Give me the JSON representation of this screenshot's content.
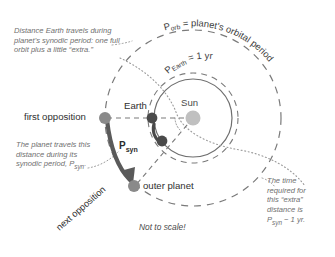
{
  "diagram": {
    "title_note": "Not to scale!",
    "colors": {
      "sun": "#c0c0c0",
      "earth_dot": "#4a4a4a",
      "planet_dot": "#8a8a8a",
      "orbit_line": "#7a7a7a",
      "arrow": "#555555",
      "caption_text": "#6f6f6f",
      "label_text": "#2f2f2f"
    },
    "labels": {
      "sun": "Sun",
      "earth": "Earth",
      "first_opposition": "first opposition",
      "next_opposition": "next opposition",
      "outer_planet": "outer planet",
      "not_to_scale": "Not to scale!",
      "p_syn": "P",
      "p_syn_sub": "syn"
    },
    "arc_labels": {
      "orbital_period": "Pₒᵣᵇ = planet's orbital period",
      "orbital_period_parts": {
        "symbol": "P",
        "subscript": "orb",
        "text": "= planet's orbital period"
      },
      "earth_period_parts": {
        "symbol": "P",
        "subscript": "Earth",
        "text": "= 1 yr"
      }
    },
    "captions": {
      "top_left": "Distance Earth travels during planet's synodic period: one full orbit plus a little “extra.”",
      "mid_left_line1": "The planet travels this",
      "mid_left_line2": "distance during its",
      "mid_left_line3": "synodic period, P",
      "mid_left_line3_sub": "syn",
      "mid_left_line3_end": ".",
      "right_line1": "The time",
      "right_line2": "required for",
      "right_line3": "this “extra”",
      "right_line4": "distance is",
      "right_line5_sym": "P",
      "right_line5_sub": "syn",
      "right_line5_rest": " − 1 yr."
    }
  }
}
